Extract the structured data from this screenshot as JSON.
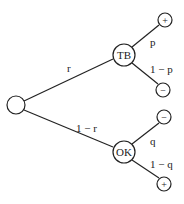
{
  "diagram": {
    "type": "probability-tree",
    "root": {
      "label": ""
    },
    "branches": [
      {
        "edge_label": "r",
        "node": "TB",
        "children": [
          {
            "edge_label": "p",
            "node": "+"
          },
          {
            "edge_label": "1 − p",
            "node": "−"
          }
        ]
      },
      {
        "edge_label": "1 − r",
        "node": "OK",
        "children": [
          {
            "edge_label": "q",
            "node": "−"
          },
          {
            "edge_label": "1 − q",
            "node": "+"
          }
        ]
      }
    ]
  }
}
